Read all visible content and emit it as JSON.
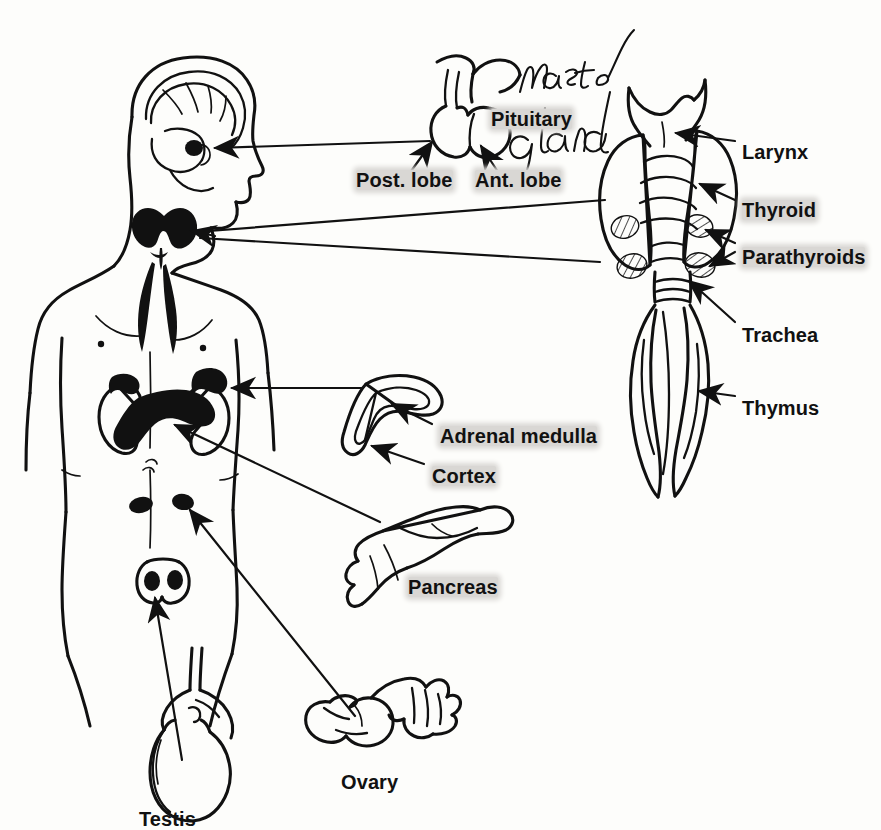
{
  "figure": {
    "background_color": "#fdfdfb",
    "ink_color": "#111111",
    "highlight_color": "#d9d7d4",
    "style": "scanned textbook line drawing with highlighter marks"
  },
  "handwriting": {
    "note": "Master gland",
    "target": "Pituitary"
  },
  "labels": [
    {
      "id": "pituitary",
      "text": "Pituitary",
      "highlighted": true,
      "x": 491,
      "y": 109
    },
    {
      "id": "post-lobe",
      "text": "Post. lobe",
      "highlighted": true,
      "x": 356,
      "y": 170
    },
    {
      "id": "ant-lobe",
      "text": "Ant. lobe",
      "highlighted": true,
      "x": 475,
      "y": 170
    },
    {
      "id": "larynx",
      "text": "Larynx",
      "highlighted": false,
      "x": 742,
      "y": 142
    },
    {
      "id": "thyroid",
      "text": "Thyroid",
      "highlighted": true,
      "x": 742,
      "y": 200
    },
    {
      "id": "parathyroids",
      "text": "Parathyroids",
      "highlighted": true,
      "x": 742,
      "y": 247
    },
    {
      "id": "trachea",
      "text": "Trachea",
      "highlighted": false,
      "x": 742,
      "y": 325
    },
    {
      "id": "thymus",
      "text": "Thymus",
      "highlighted": false,
      "x": 742,
      "y": 398
    },
    {
      "id": "adrenal-medulla",
      "text": "Adrenal medulla",
      "highlighted": true,
      "x": 440,
      "y": 426
    },
    {
      "id": "cortex",
      "text": "Cortex",
      "highlighted": true,
      "x": 432,
      "y": 466
    },
    {
      "id": "pancreas",
      "text": "Pancreas",
      "highlighted": true,
      "x": 408,
      "y": 577
    },
    {
      "id": "ovary",
      "text": "Ovary",
      "highlighted": false,
      "x": 341,
      "y": 772
    },
    {
      "id": "testis",
      "text": "Testis",
      "highlighted": false,
      "x": 139,
      "y": 809
    }
  ],
  "structures": [
    {
      "id": "human-figure",
      "name": "Human body outline, head and torso, profile head"
    },
    {
      "id": "brain",
      "name": "Brain with cerebellum in skull"
    },
    {
      "id": "pituitary-in-head",
      "name": "Pituitary gland marker in head",
      "filled": true
    },
    {
      "id": "thyroid-in-neck",
      "name": "Thyroid gland on neck",
      "filled": true
    },
    {
      "id": "thymus-in-chest",
      "name": "Thymus in chest",
      "filled": true
    },
    {
      "id": "kidneys",
      "name": "Pair of kidneys"
    },
    {
      "id": "adrenals-on-kidneys",
      "name": "Adrenal glands atop kidneys",
      "filled": true
    },
    {
      "id": "pancreas-in-abdomen",
      "name": "Pancreas in abdomen",
      "filled": true
    },
    {
      "id": "ovaries-in-pelvis",
      "name": "Ovaries in pelvis",
      "filled": true
    },
    {
      "id": "testes-in-scrotum",
      "name": "Testes",
      "filled": true
    },
    {
      "id": "pituitary-inset",
      "name": "Pituitary gland detail with anterior and posterior lobes"
    },
    {
      "id": "thyroid-inset",
      "name": "Larynx, thyroid, parathyroids, trachea and thymus specimen"
    },
    {
      "id": "adrenal-inset",
      "name": "Adrenal gland cross-section showing medulla and cortex"
    },
    {
      "id": "pancreas-inset",
      "name": "Pancreas detail drawing"
    },
    {
      "id": "ovary-inset",
      "name": "Ovary with fallopian tube fimbriae"
    },
    {
      "id": "testis-inset",
      "name": "Testis with epididymis and vas deferens"
    }
  ],
  "leaders": [
    {
      "from": "pituitary-inset",
      "to": "pituitary-in-head",
      "arrow": true
    },
    {
      "from": "thyroid-inset",
      "to": "thyroid-in-neck",
      "arrow": true
    },
    {
      "from": "adrenal-inset",
      "to": "adrenals-on-kidneys",
      "arrow": true
    },
    {
      "from": "pancreas-inset",
      "to": "pancreas-in-abdomen",
      "arrow": true
    },
    {
      "from": "ovary-inset",
      "to": "ovaries-in-pelvis",
      "arrow": true
    },
    {
      "from": "testis-inset",
      "to": "testes-in-scrotum",
      "arrow": true
    }
  ]
}
